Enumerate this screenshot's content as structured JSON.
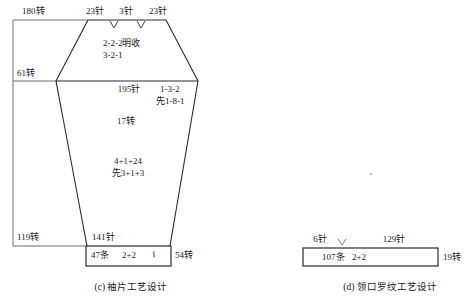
{
  "figure": {
    "title_c": "(c) 袖片工艺设计",
    "title_d": "(d) 领口罗纹工艺设计"
  },
  "sleeve": {
    "caption": "(c) 袖片工艺设计",
    "left_outer_top": "180转",
    "left_outer_mid": "61转",
    "left_outer_bottom": "119转",
    "top_left_needles": "23针",
    "top_center_needles": "3针",
    "top_right_needles": "23针",
    "cap_line1": "2-2-2明收",
    "cap_line2": "3-2-1",
    "body_top_needles": "195针",
    "right_note_line1": "1-3-2",
    "right_note_line2": "先1-8-1",
    "body_rows": "17转",
    "taper_line1": "4+1+24",
    "taper_line2": "先3+1+3",
    "bottom_needles": "141针",
    "rib_count": "47条",
    "rib_ratio": "2+2",
    "rib_symbol": "∽",
    "right_bottom_rows": "54转"
  },
  "collar": {
    "caption": "(d) 领口罗纹工艺设计",
    "left_needles": "6针",
    "right_needles": "129针",
    "rib_count": "107条",
    "rib_ratio": "2+2",
    "rows": "19转",
    "arrow_marker": "v"
  },
  "colors": {
    "stroke": "#2b2b2b",
    "stroke_light": "#6d6d6d",
    "text": "#1a1a1a",
    "background": "#ffffff"
  }
}
